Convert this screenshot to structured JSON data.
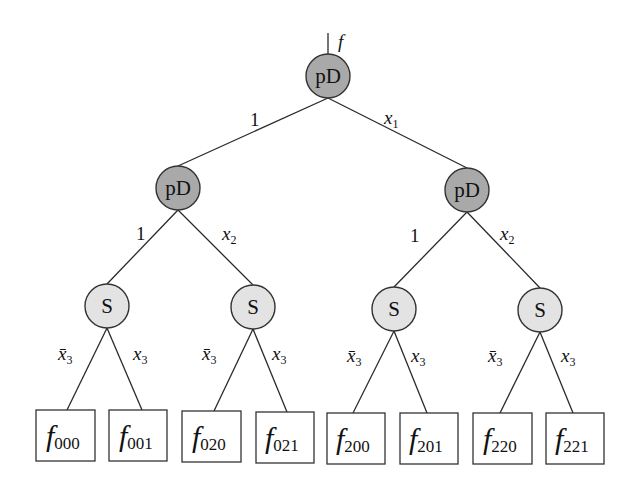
{
  "diagram": {
    "type": "decision-tree",
    "colors": {
      "pd_fill": "#a9a9a9",
      "s_fill": "#e3e3e3",
      "stroke": "#333333"
    },
    "root": {
      "output_label": "f",
      "node_label": "pD",
      "edges": {
        "left": "1",
        "right_var": "x",
        "right_sub": "1"
      }
    },
    "level2": [
      {
        "node_label": "pD",
        "edges": {
          "left": "1",
          "right_var": "x",
          "right_sub": "2"
        }
      },
      {
        "node_label": "pD",
        "edges": {
          "left": "1",
          "right_var": "x",
          "right_sub": "2"
        }
      }
    ],
    "level3": [
      {
        "node_label": "S",
        "edges": {
          "left_var": "x̄",
          "left_sub": "3",
          "right_var": "x",
          "right_sub": "3"
        }
      },
      {
        "node_label": "S",
        "edges": {
          "left_var": "x̄",
          "left_sub": "3",
          "right_var": "x",
          "right_sub": "3"
        }
      },
      {
        "node_label": "S",
        "edges": {
          "left_var": "x̄",
          "left_sub": "3",
          "right_var": "x",
          "right_sub": "3"
        }
      },
      {
        "node_label": "S",
        "edges": {
          "left_var": "x̄",
          "left_sub": "3",
          "right_var": "x",
          "right_sub": "3"
        }
      }
    ],
    "leaves": [
      {
        "symbol": "f",
        "sub": "000"
      },
      {
        "symbol": "f",
        "sub": "001"
      },
      {
        "symbol": "f",
        "sub": "020"
      },
      {
        "symbol": "f",
        "sub": "021"
      },
      {
        "symbol": "f",
        "sub": "200"
      },
      {
        "symbol": "f",
        "sub": "201"
      },
      {
        "symbol": "f",
        "sub": "220"
      },
      {
        "symbol": "f",
        "sub": "221"
      }
    ]
  }
}
